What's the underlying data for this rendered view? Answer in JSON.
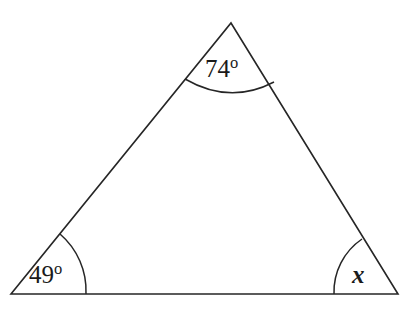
{
  "figure": {
    "kind": "triangle-angle-diagram",
    "stroke_color": "#262626",
    "background_color": "#ffffff",
    "stroke_width": 1.6,
    "vertices": {
      "apex": {
        "x": 231,
        "y": 23
      },
      "bottom_left": {
        "x": 11,
        "y": 294
      },
      "bottom_right": {
        "x": 398,
        "y": 294
      }
    },
    "sides": [
      {
        "name": "left-side",
        "from": "bottom_left",
        "to": "apex"
      },
      {
        "name": "right-side",
        "from": "apex",
        "to": "bottom_right"
      },
      {
        "name": "base",
        "from": "bottom_left",
        "to": "bottom_right"
      }
    ]
  },
  "angles": {
    "top": {
      "label": "74",
      "degree_symbol": "o",
      "value": 74,
      "unit": "degrees",
      "arc": {
        "radius": 75,
        "start_x": 185,
        "start_y": 79,
        "end_x": 274,
        "end_y": 82,
        "sweep_x": 230,
        "sweep_y": 98
      }
    },
    "bottom_left": {
      "label": "49",
      "degree_symbol": "o",
      "value": 49,
      "unit": "degrees",
      "arc": {
        "radius": 75,
        "start_x": 60,
        "start_y": 234,
        "end_x": 86,
        "end_y": 294
      }
    },
    "bottom_right": {
      "label": "x",
      "degree_symbol": "",
      "value": null,
      "unit": "unknown",
      "arc": {
        "radius": 64,
        "start_x": 334,
        "start_y": 294,
        "end_x": 362,
        "end_y": 239
      }
    }
  },
  "chart_data": {
    "type": "diagram",
    "title": "",
    "shape": "triangle",
    "labels": [
      "74o",
      "49o",
      "x"
    ],
    "values": [
      74,
      49,
      null
    ],
    "annotations": [
      {
        "at": "apex",
        "text": "74o"
      },
      {
        "at": "bottom-left",
        "text": "49o"
      },
      {
        "at": "bottom-right",
        "text": "x"
      }
    ]
  }
}
